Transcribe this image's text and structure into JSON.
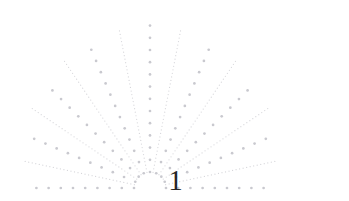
{
  "page": {
    "width": 349,
    "height": 201,
    "background_color": "#ffffff"
  },
  "folio": {
    "number": "1",
    "color": "#262626",
    "center_x": 175,
    "baseline_y": 190,
    "font_size": 29
  },
  "ornament": {
    "name": "dotted-fan-sunburst",
    "description": "Decorative half-fan of dotted rays radiating upward and outward from a point just above the page number",
    "origin_x": 150,
    "origin_y": 188,
    "dot_color": "#c9c9cf",
    "fine_dot_color": "#d6d6da",
    "large_dot_radius": 1.35,
    "large_dot_spacing": 12.2,
    "fine_dot_radius": 0.62,
    "fine_dot_spacing": 3.6,
    "inner_gap": 16,
    "ray_count": 17,
    "rays": [
      {
        "index": 0,
        "angle_deg": 180,
        "style": "large",
        "length": 124
      },
      {
        "index": 1,
        "angle_deg": 168,
        "style": "fine",
        "length": 128
      },
      {
        "index": 2,
        "angle_deg": 157,
        "style": "large",
        "length": 136
      },
      {
        "index": 3,
        "angle_deg": 146,
        "style": "fine",
        "length": 142
      },
      {
        "index": 4,
        "angle_deg": 135,
        "style": "large",
        "length": 150
      },
      {
        "index": 5,
        "angle_deg": 124,
        "style": "fine",
        "length": 156
      },
      {
        "index": 6,
        "angle_deg": 113,
        "style": "large",
        "length": 160
      },
      {
        "index": 7,
        "angle_deg": 101,
        "style": "fine",
        "length": 162
      },
      {
        "index": 8,
        "angle_deg": 90,
        "style": "large",
        "length": 163
      },
      {
        "index": 9,
        "angle_deg": 79,
        "style": "fine",
        "length": 162
      },
      {
        "index": 10,
        "angle_deg": 67,
        "style": "large",
        "length": 160
      },
      {
        "index": 11,
        "angle_deg": 56,
        "style": "fine",
        "length": 156
      },
      {
        "index": 12,
        "angle_deg": 45,
        "style": "large",
        "length": 150
      },
      {
        "index": 13,
        "angle_deg": 34,
        "style": "fine",
        "length": 142
      },
      {
        "index": 14,
        "angle_deg": 23,
        "style": "large",
        "length": 136
      },
      {
        "index": 15,
        "angle_deg": 12,
        "style": "fine",
        "length": 128
      },
      {
        "index": 16,
        "angle_deg": 0,
        "style": "large",
        "length": 124
      }
    ]
  }
}
